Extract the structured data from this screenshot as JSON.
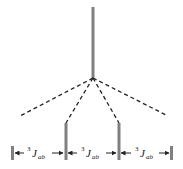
{
  "diagram": {
    "type": "nmr-splitting-tree",
    "colors": {
      "line": "#808080",
      "dash": "#222222",
      "text": "#222222"
    },
    "parent_peak": {
      "x": 93,
      "y_top": 7,
      "y_bottom": 78
    },
    "child_peaks": [
      {
        "x": 12,
        "y_top": 146,
        "y_bottom": 160
      },
      {
        "x": 66,
        "y_top": 123,
        "y_bottom": 160
      },
      {
        "x": 119,
        "y_top": 123,
        "y_bottom": 160
      },
      {
        "x": 171,
        "y_top": 146,
        "y_bottom": 160
      }
    ],
    "coupling_labels": [
      {
        "sup": "3",
        "main": "J",
        "sub": "ab"
      },
      {
        "sup": "3",
        "main": "J",
        "sub": "ab"
      },
      {
        "sup": "3",
        "main": "J",
        "sub": "ab"
      }
    ]
  }
}
